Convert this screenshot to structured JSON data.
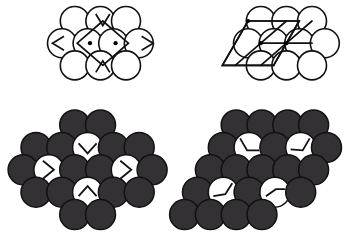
{
  "figure": {
    "title": "",
    "background_color": "#ffffff",
    "width": 362,
    "height": 241,
    "colors": {
      "outline": "#111111",
      "circle_white_fill": "#ffffff",
      "circle_dark_fill": "#333133",
      "mark_stroke": "#111111",
      "dot_fill": "#000000"
    },
    "panels": [
      {
        "id": "top-left",
        "name": "top-left-panel",
        "label": "",
        "style": "outline",
        "radius": 14.5,
        "dx": 25.6,
        "dy": 22.2,
        "origin": {
          "x": 62,
          "y": 21
        },
        "description": "close-packed circle layer, rows of 3/4/3, rhombic unit cell overlay with two interstitial dots",
        "rows": [
          {
            "count": 3,
            "offset": 0.5,
            "fills": [
              "white",
              "white",
              "white"
            ]
          },
          {
            "count": 4,
            "offset": 0.0,
            "fills": [
              "white",
              "white",
              "white",
              "white"
            ]
          },
          {
            "count": 3,
            "offset": 0.5,
            "fills": [
              "white",
              "white",
              "white"
            ]
          }
        ],
        "dots": [
          {
            "x": 90.0,
            "y": 43.2
          },
          {
            "x": 115.6,
            "y": 43.2
          }
        ],
        "dot_radius": 2.1,
        "cell": {
          "type": "rhombus",
          "points": "102.8,21.0 128.4,43.2 102.8,65.4 77.2,43.2"
        },
        "wedges": [
          {
            "name": "wedge-left",
            "points": "64.0,36.2 52.5,43.2 64.0,50.2",
            "at": {
              "x": 58,
              "y": 43.2
            }
          },
          {
            "name": "wedge-right",
            "points": "141.6,36.2 153.1,43.2 141.6,50.2",
            "at": {
              "x": 147,
              "y": 43.2
            }
          },
          {
            "name": "wedge-top",
            "points": "95.8,14.0 102.8,25.5 109.8,14.0",
            "at": {
              "x": 102.8,
              "y": 20
            }
          },
          {
            "name": "wedge-bottom",
            "points": "95.8,72.4 102.8,60.9 109.8,72.4",
            "at": {
              "x": 102.8,
              "y": 66
            }
          }
        ]
      },
      {
        "id": "top-right",
        "name": "top-right-panel",
        "label": "",
        "style": "outline",
        "radius": 14.5,
        "dx": 25.6,
        "dy": 22.2,
        "origin": {
          "x": 248,
          "y": 21
        },
        "description": "close-packed circle layer, rows of 3/4/3, oblique parallelogram lattice overlay with three dots at lattice nodes",
        "rows": [
          {
            "count": 3,
            "offset": 0.5,
            "fills": [
              "white",
              "white",
              "white"
            ]
          },
          {
            "count": 4,
            "offset": 0.0,
            "fills": [
              "white",
              "white",
              "white",
              "white"
            ]
          },
          {
            "count": 3,
            "offset": 0.5,
            "fills": [
              "white",
              "white",
              "white"
            ]
          }
        ],
        "dots": [
          {
            "x": 248.0,
            "y": 21.0
          },
          {
            "x": 286.4,
            "y": 43.2
          },
          {
            "x": 260.8,
            "y": 43.2
          }
        ],
        "dot_radius": 2.1,
        "cell": {
          "type": "parallelogram",
          "points": "248.0,21.0 299.2,21.0 273.6,65.4 222.4,65.4"
        },
        "lines": [
          {
            "from": {
              "x": 248.0,
              "y": 21.0
            },
            "to": {
              "x": 299.2,
              "y": 21.0
            }
          },
          {
            "from": {
              "x": 299.2,
              "y": 21.0
            },
            "to": {
              "x": 273.6,
              "y": 65.4
            }
          },
          {
            "from": {
              "x": 273.6,
              "y": 65.4
            },
            "to": {
              "x": 222.4,
              "y": 65.4
            }
          },
          {
            "from": {
              "x": 222.4,
              "y": 65.4
            },
            "to": {
              "x": 248.0,
              "y": 21.0
            }
          },
          {
            "from": {
              "x": 260.8,
              "y": 43.2
            },
            "to": {
              "x": 312.0,
              "y": 43.2
            }
          },
          {
            "from": {
              "x": 286.4,
              "y": 43.2
            },
            "to": {
              "x": 312.0,
              "y": 21.0
            }
          },
          {
            "from": {
              "x": 260.8,
              "y": 43.2
            },
            "to": {
              "x": 286.4,
              "y": 21.0
            }
          },
          {
            "from": {
              "x": 260.8,
              "y": 43.2
            },
            "to": {
              "x": 235.2,
              "y": 65.4
            }
          },
          {
            "from": {
              "x": 286.4,
              "y": 43.2
            },
            "to": {
              "x": 260.8,
              "y": 65.4
            }
          }
        ]
      },
      {
        "id": "bottom-left",
        "name": "bottom-left-panel",
        "label": "",
        "style": "filled",
        "radius": 15.0,
        "dx": 25.8,
        "dy": 22.4,
        "origin": {
          "x": 36,
          "y": 125
        },
        "description": "hexagonal cluster of 22 spheres; 4 white interstitial circles carry wedge marks pointing to the central rhombic cell",
        "rows": [
          {
            "count": 2,
            "offset": 1.5,
            "fills": [
              "dark",
              "dark"
            ]
          },
          {
            "count": 5,
            "offset": 0.0,
            "fills": [
              "dark",
              "dark",
              "white-wedge-down",
              "dark",
              "dark"
            ]
          },
          {
            "count": 6,
            "offset": -0.5,
            "fills": [
              "dark",
              "white-wedge-right",
              "dark",
              "dark",
              "white-wedge-right",
              "dark"
            ]
          },
          {
            "count": 5,
            "offset": 0.0,
            "fills": [
              "dark",
              "dark",
              "white-wedge-up",
              "dark",
              "dark"
            ]
          },
          {
            "count": 2,
            "offset": 1.5,
            "fills": [
              "dark",
              "dark"
            ]
          }
        ],
        "marks": [
          {
            "name": "wedge-down-mark",
            "type": "chevron-down",
            "cx": 87.6,
            "cy": 147.4
          },
          {
            "name": "wedge-right-mark-left",
            "type": "chevron-right",
            "cx": 49.0,
            "cy": 169.8
          },
          {
            "name": "wedge-right-mark-right",
            "type": "chevron-right",
            "cx": 126.4,
            "cy": 169.8
          },
          {
            "name": "wedge-up-mark",
            "type": "chevron-up",
            "cx": 87.6,
            "cy": 192.2
          }
        ]
      },
      {
        "id": "bottom-right",
        "name": "bottom-right-panel",
        "label": "",
        "style": "filled",
        "radius": 15.0,
        "dx": 25.8,
        "dy": 22.4,
        "origin": {
          "x": 222,
          "y": 125
        },
        "description": "rhombic (oblique) cluster of 23 spheres; 4 white interstitial circles carry bent L-shaped lattice marks",
        "rows": [
          {
            "count": 4,
            "offset": 0.55,
            "fills": [
              "dark",
              "dark",
              "dark",
              "dark"
            ]
          },
          {
            "count": 5,
            "offset": 0.05,
            "fills": [
              "dark",
              "white-L-a",
              "dark",
              "white-L-b",
              "dark"
            ]
          },
          {
            "count": 5,
            "offset": -0.45,
            "fills": [
              "dark",
              "dark",
              "dark",
              "dark",
              "dark"
            ]
          },
          {
            "count": 5,
            "offset": -0.95,
            "fills": [
              "dark",
              "white-L-c",
              "dark",
              "white-L-d",
              "dark"
            ]
          },
          {
            "count": 4,
            "offset": -1.45,
            "fills": [
              "dark",
              "dark",
              "dark",
              "dark"
            ]
          }
        ],
        "marks": [
          {
            "name": "bent-line-mark-a",
            "type": "bent-nw",
            "cx": 249.3,
            "cy": 147.4
          },
          {
            "name": "bent-line-mark-b",
            "type": "bent-ne",
            "cx": 300.9,
            "cy": 147.4
          },
          {
            "name": "bent-line-mark-c",
            "type": "bent-sw",
            "cx": 223.5,
            "cy": 192.2
          },
          {
            "name": "bent-line-mark-d",
            "type": "bent-se",
            "cx": 275.1,
            "cy": 192.2
          }
        ]
      }
    ]
  }
}
